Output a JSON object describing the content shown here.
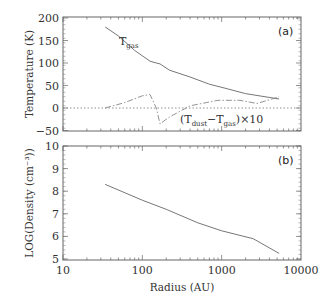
{
  "chart_data": [
    {
      "type": "line",
      "panel_label": "(a)",
      "xlabel": "Radius (AU)",
      "xscale": "log",
      "xlim": [
        10,
        10000
      ],
      "xticks": [
        "10",
        "100",
        "1000",
        "10000"
      ],
      "ylabel": "Temperature (K)",
      "ylim": [
        -55,
        200
      ],
      "yticks": [
        "200",
        "150",
        "100",
        "50",
        "0",
        "-50"
      ],
      "reference_line": {
        "y": 0,
        "style": "dotted"
      },
      "series": [
        {
          "name": "T_gas",
          "label_main": "T",
          "label_sub": "gas",
          "style": "solid",
          "x": [
            34,
            50,
            80,
            125,
            150,
            167,
            220,
            400,
            700,
            1100,
            2000,
            5300
          ],
          "values": [
            180,
            160,
            128,
            104,
            100,
            98,
            84,
            69,
            53,
            44,
            32,
            20
          ]
        },
        {
          "name": "(T_dust - T_gas) x 10",
          "label_parts": {
            "open": "(T",
            "sub1": "dust",
            "mid": "−T",
            "sub2": "gas",
            "close": ")×10"
          },
          "style": "dash-dot",
          "x": [
            34,
            60,
            100,
            125,
            150,
            167,
            220,
            400,
            900,
            1700,
            2800,
            5300
          ],
          "values": [
            0,
            12,
            27,
            30,
            0,
            -35,
            -20,
            5,
            17,
            17,
            10,
            25
          ]
        }
      ]
    },
    {
      "type": "line",
      "panel_label": "(b)",
      "xlabel": "Radius (AU)",
      "xscale": "log",
      "xlim": [
        10,
        10000
      ],
      "xticks": [
        "10",
        "100",
        "1000",
        "10000"
      ],
      "ylabel": "LOG(Density (cm⁻³))",
      "ylim": [
        5,
        10
      ],
      "yticks": [
        "10",
        "9",
        "8",
        "7",
        "6",
        "5"
      ],
      "series": [
        {
          "name": "LOG density",
          "style": "solid",
          "x": [
            34,
            100,
            200,
            500,
            1000,
            2500,
            5300
          ],
          "values": [
            8.3,
            7.6,
            7.2,
            6.6,
            6.25,
            5.9,
            5.25
          ]
        }
      ]
    }
  ],
  "labels": {
    "panel_a": "(a)",
    "panel_b": "(b)",
    "ylabel_top": "Temperature (K)",
    "ylabel_bottom": "LOG(Density (cm⁻³))",
    "xlabel": "Radius (AU)",
    "tgas_main": "T",
    "tgas_sub": "gas",
    "diff_open": "(T",
    "diff_sub1": "dust",
    "diff_mid": "−T",
    "diff_sub2": "gas",
    "diff_close": ")×10"
  },
  "colors": {
    "line": "#777777",
    "axis": "#555555",
    "text": "#333333"
  }
}
